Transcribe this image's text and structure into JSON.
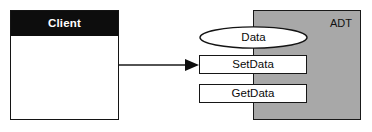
{
  "diagram": {
    "background_color": "#ffffff",
    "client": {
      "header_label": "Client",
      "header_background": "#0d0d0d",
      "header_text_color": "#ffffff",
      "body_background": "#ffffff",
      "border_color": "#141414"
    },
    "adt": {
      "label": "ADT",
      "fill_color": "#a8a8a8",
      "border_color": "#191919",
      "text_color": "#111111"
    },
    "interface": {
      "data_ellipse": {
        "label": "Data",
        "fill_color": "#ffffff",
        "border_color": "#141414"
      },
      "operations": [
        {
          "label": "SetData",
          "fill_color": "#ffffff",
          "border_color": "#161616"
        },
        {
          "label": "GetData",
          "fill_color": "#ffffff",
          "border_color": "#161616"
        }
      ]
    },
    "connector": {
      "name": "client-to-setdata-arrow",
      "from": "Client",
      "to": "SetData",
      "style": "solid-line-filled-arrowhead",
      "color": "#1a1a1a"
    }
  }
}
